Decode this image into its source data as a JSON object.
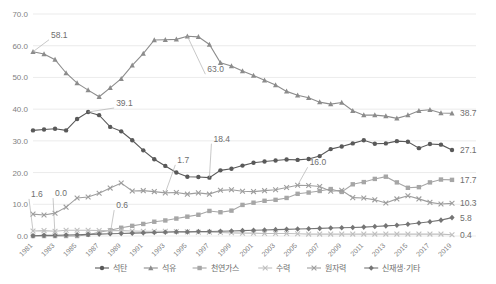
{
  "chart_data": {
    "type": "line",
    "title": "",
    "xlabel": "",
    "ylabel": "",
    "ylim": [
      0,
      70
    ],
    "yticks": [
      0.0,
      10.0,
      20.0,
      30.0,
      40.0,
      50.0,
      60.0,
      70.0
    ],
    "ytick_labels": [
      "0.0",
      "10.0",
      "20.0",
      "30.0",
      "40.0",
      "50.0",
      "60.0",
      "70.0"
    ],
    "grid": true,
    "legend_position": "bottom",
    "x": [
      1981,
      1982,
      1983,
      1984,
      1985,
      1986,
      1987,
      1988,
      1989,
      1990,
      1991,
      1992,
      1993,
      1994,
      1995,
      1996,
      1997,
      1998,
      1999,
      2000,
      2001,
      2002,
      2003,
      2004,
      2005,
      2006,
      2007,
      2008,
      2009,
      2010,
      2011,
      2012,
      2013,
      2014,
      2015,
      2016,
      2017,
      2018,
      2019
    ],
    "xtick_labels": [
      "1981",
      "1983",
      "1985",
      "1987",
      "1989",
      "1991",
      "1993",
      "1995",
      "1997",
      "1999",
      "2001",
      "2003",
      "2005",
      "2007",
      "2009",
      "2011",
      "2013",
      "2015",
      "2017",
      "2019"
    ],
    "xtick_years": [
      1981,
      1983,
      1985,
      1987,
      1989,
      1991,
      1993,
      1995,
      1997,
      1999,
      2001,
      2003,
      2005,
      2007,
      2009,
      2011,
      2013,
      2015,
      2017,
      2019
    ],
    "series": [
      {
        "name": "석탄",
        "key": "coal",
        "color": "#595959",
        "marker": "circle",
        "values": [
          33.3,
          33.6,
          33.8,
          33.3,
          36.9,
          39.1,
          38.1,
          34.4,
          33.0,
          30.2,
          27.0,
          24.2,
          22.1,
          20.0,
          18.7,
          18.6,
          18.4,
          20.7,
          21.2,
          22.2,
          23.1,
          23.5,
          23.8,
          24.1,
          24.0,
          24.3,
          25.2,
          27.4,
          28.2,
          29.2,
          30.2,
          29.1,
          29.2,
          29.9,
          29.7,
          27.7,
          29.0,
          28.8,
          27.1
        ],
        "end_label": "27.1",
        "annotations": [
          {
            "label": "39.1",
            "year": 1986,
            "value": 39.1
          },
          {
            "label": "18.4",
            "year": 1997,
            "value": 18.4
          }
        ]
      },
      {
        "name": "석유",
        "key": "oil",
        "color": "#8c8c8c",
        "marker": "triangle",
        "values": [
          58.1,
          57.4,
          55.6,
          51.4,
          48.2,
          46.0,
          43.9,
          46.7,
          49.6,
          53.8,
          57.5,
          61.8,
          61.9,
          62.0,
          63.0,
          62.8,
          60.4,
          54.6,
          53.6,
          52.0,
          50.6,
          49.1,
          47.6,
          45.6,
          44.4,
          43.6,
          42.2,
          41.6,
          42.1,
          39.5,
          38.1,
          38.1,
          37.8,
          37.1,
          38.1,
          39.5,
          39.8,
          38.8,
          38.7
        ],
        "end_label": "38.7",
        "annotations": [
          {
            "label": "58.1",
            "year": 1981,
            "value": 58.1
          },
          {
            "label": "63.0",
            "year": 1995,
            "value": 63.0
          }
        ]
      },
      {
        "name": "천연가스",
        "key": "gas",
        "color": "#a6a6a6",
        "marker": "square",
        "values": [
          0.0,
          0.0,
          0.0,
          0.0,
          0.0,
          0.4,
          1.2,
          1.8,
          2.6,
          3.2,
          3.8,
          4.5,
          4.9,
          5.5,
          6.1,
          6.7,
          7.9,
          7.5,
          8.0,
          9.8,
          10.5,
          11.1,
          11.4,
          12.0,
          13.3,
          13.7,
          14.2,
          14.8,
          13.9,
          16.3,
          17.0,
          18.0,
          18.7,
          16.9,
          15.2,
          15.4,
          16.9,
          17.8,
          17.7
        ],
        "end_label": "17.7",
        "annotations": [
          {
            "label": "0.0",
            "year": 1983,
            "value": 0.0
          }
        ]
      },
      {
        "name": "수력",
        "key": "hydro",
        "color": "#bfbfbf",
        "marker": "cross",
        "values": [
          1.6,
          1.7,
          1.5,
          1.8,
          1.8,
          1.8,
          1.7,
          1.7,
          1.7,
          1.6,
          1.5,
          1.5,
          1.5,
          1.4,
          1.3,
          1.2,
          1.2,
          1.1,
          1.0,
          0.9,
          0.9,
          0.8,
          0.8,
          0.8,
          0.7,
          0.6,
          0.6,
          0.6,
          0.6,
          0.6,
          0.6,
          0.6,
          0.6,
          0.6,
          0.6,
          0.6,
          0.6,
          0.6,
          0.4
        ],
        "end_label": "0.4",
        "annotations": [
          {
            "label": "1.6",
            "year": 1981,
            "value": 1.6
          },
          {
            "label": "0.6",
            "year": 1988,
            "value": 0.6
          }
        ]
      },
      {
        "name": "원자력",
        "key": "nuclear",
        "color": "#9e9e9e",
        "marker": "cross",
        "values": [
          6.9,
          6.6,
          7.2,
          9.1,
          12.0,
          12.3,
          13.5,
          15.1,
          16.7,
          14.2,
          14.3,
          14.0,
          13.6,
          13.7,
          13.2,
          13.6,
          13.2,
          14.4,
          14.6,
          14.1,
          14.0,
          14.3,
          14.6,
          15.3,
          16.0,
          15.9,
          15.6,
          14.1,
          14.4,
          12.1,
          12.0,
          11.4,
          10.4,
          11.7,
          12.7,
          11.7,
          10.6,
          10.1,
          10.3
        ],
        "end_label": "10.3",
        "annotations": [
          {
            "label": "1.7",
            "year": 1993,
            "value": 13.6
          },
          {
            "label": "16.0",
            "year": 2005,
            "value": 16.0
          }
        ]
      },
      {
        "name": "신재생·기타",
        "key": "renewable",
        "color": "#757575",
        "marker": "diamond",
        "values": [
          0.1,
          0.2,
          0.2,
          0.3,
          0.4,
          0.5,
          0.6,
          0.7,
          0.8,
          0.9,
          1.0,
          1.1,
          1.2,
          1.3,
          1.3,
          1.4,
          1.4,
          1.5,
          1.6,
          1.7,
          1.8,
          1.9,
          2.0,
          2.1,
          2.2,
          2.3,
          2.4,
          2.5,
          2.6,
          2.7,
          2.8,
          3.0,
          3.2,
          3.4,
          3.7,
          4.1,
          4.5,
          5.0,
          5.8
        ],
        "end_label": "5.8",
        "annotations": []
      }
    ]
  }
}
